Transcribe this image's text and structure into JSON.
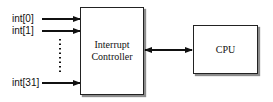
{
  "diagram": {
    "inputs": [
      {
        "label": "int[0]"
      },
      {
        "label": "int[1]"
      },
      {
        "label": "int[31]"
      }
    ],
    "controller": {
      "line1": "Interrupt",
      "line2": "Controller"
    },
    "cpu": {
      "label": "CPU"
    },
    "connections": [
      {
        "from": "int[0]",
        "to": "Interrupt Controller",
        "type": "arrow"
      },
      {
        "from": "int[1]",
        "to": "Interrupt Controller",
        "type": "arrow"
      },
      {
        "from": "int[31]",
        "to": "Interrupt Controller",
        "type": "arrow"
      },
      {
        "from": "Interrupt Controller",
        "to": "CPU",
        "type": "bidirectional-arrow"
      }
    ],
    "ellipsis": "vertical-dotted-line"
  }
}
